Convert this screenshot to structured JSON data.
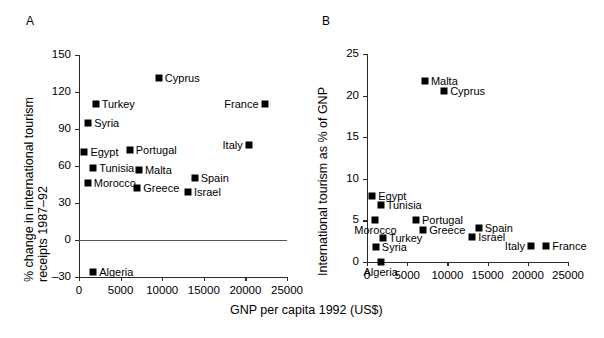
{
  "figure": {
    "xlabel": "GNP per capita 1992 (US$)",
    "panel_a_label": "A",
    "panel_b_label": "B"
  },
  "chart_data": [
    {
      "type": "scatter",
      "panel": "A",
      "title": "",
      "xlabel": "GNP per capita 1992 (US$)",
      "ylabel_line1": "% change in international tourism",
      "ylabel_line2": "receipts 1987–92",
      "xlim": [
        0,
        25000
      ],
      "ylim": [
        -30,
        150
      ],
      "xticks": [
        0,
        5000,
        10000,
        15000,
        20000,
        25000
      ],
      "xticklabels": [
        "0",
        "5000",
        "10000",
        "15000",
        "20000",
        "25000"
      ],
      "yticks": [
        -30,
        0,
        30,
        60,
        90,
        120,
        150
      ],
      "yticklabels": [
        "–30",
        "0",
        "30",
        "60",
        "90",
        "120",
        "150"
      ],
      "grid": false,
      "legend": "none",
      "zero_line": 0,
      "points": [
        {
          "label": "Cyprus",
          "x": 9600,
          "y": 131,
          "label_pos": "right"
        },
        {
          "label": "Turkey",
          "x": 2000,
          "y": 110,
          "label_pos": "right"
        },
        {
          "label": "France",
          "x": 22300,
          "y": 110,
          "label_pos": "left"
        },
        {
          "label": "Syria",
          "x": 1100,
          "y": 95,
          "label_pos": "right"
        },
        {
          "label": "Italy",
          "x": 20400,
          "y": 77,
          "label_pos": "left"
        },
        {
          "label": "Egypt",
          "x": 650,
          "y": 71,
          "label_pos": "right"
        },
        {
          "label": "Portugal",
          "x": 6100,
          "y": 73,
          "label_pos": "right"
        },
        {
          "label": "Tunisia",
          "x": 1700,
          "y": 58,
          "label_pos": "right"
        },
        {
          "label": "Malta",
          "x": 7200,
          "y": 57,
          "label_pos": "right"
        },
        {
          "label": "Morocco",
          "x": 1050,
          "y": 46,
          "label_pos": "right"
        },
        {
          "label": "Greece",
          "x": 7000,
          "y": 42,
          "label_pos": "right"
        },
        {
          "label": "Spain",
          "x": 13900,
          "y": 50,
          "label_pos": "right"
        },
        {
          "label": "Israel",
          "x": 13100,
          "y": 39,
          "label_pos": "right"
        },
        {
          "label": "Algeria",
          "x": 1700,
          "y": -26,
          "label_pos": "right"
        }
      ]
    },
    {
      "type": "scatter",
      "panel": "B",
      "title": "",
      "xlabel": "GNP per capita 1992 (US$)",
      "ylabel_line1": "International tourism as % of GNP",
      "ylabel_line2": "",
      "xlim": [
        0,
        25000
      ],
      "ylim": [
        0,
        25
      ],
      "xticks": [
        0,
        5000,
        10000,
        15000,
        20000,
        25000
      ],
      "xticklabels": [
        "0",
        "5000",
        "10000",
        "15000",
        "20000",
        "25000"
      ],
      "yticks": [
        0,
        5,
        10,
        15,
        20,
        25
      ],
      "yticklabels": [
        "0",
        "5",
        "10",
        "15",
        "20",
        "25"
      ],
      "grid": false,
      "legend": "none",
      "points": [
        {
          "label": "Malta",
          "x": 7200,
          "y": 21.8,
          "label_pos": "right"
        },
        {
          "label": "Cyprus",
          "x": 9600,
          "y": 20.6,
          "label_pos": "right"
        },
        {
          "label": "Egypt",
          "x": 650,
          "y": 7.9,
          "label_pos": "right"
        },
        {
          "label": "Tunisia",
          "x": 1700,
          "y": 6.8,
          "label_pos": "right"
        },
        {
          "label": "Morocco",
          "x": 1050,
          "y": 5.0,
          "label_pos": "below"
        },
        {
          "label": "Portugal",
          "x": 6100,
          "y": 5.0,
          "label_pos": "right"
        },
        {
          "label": "Greece",
          "x": 7000,
          "y": 3.8,
          "label_pos": "right"
        },
        {
          "label": "Spain",
          "x": 13900,
          "y": 4.1,
          "label_pos": "right"
        },
        {
          "label": "Turkey",
          "x": 2000,
          "y": 2.9,
          "label_pos": "right"
        },
        {
          "label": "Israel",
          "x": 13100,
          "y": 3.0,
          "label_pos": "right"
        },
        {
          "label": "Syria",
          "x": 1100,
          "y": 1.8,
          "label_pos": "right"
        },
        {
          "label": "Italy",
          "x": 20400,
          "y": 1.9,
          "label_pos": "left"
        },
        {
          "label": "France",
          "x": 22300,
          "y": 1.9,
          "label_pos": "right"
        },
        {
          "label": "Algeria",
          "x": 1700,
          "y": 0.05,
          "label_pos": "below"
        }
      ]
    }
  ]
}
